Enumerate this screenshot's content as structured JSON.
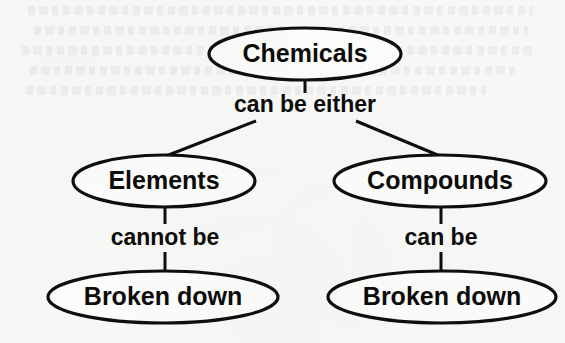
{
  "diagram": {
    "type": "concept-map",
    "title_text_present": false,
    "background_color": "#f7f7f6",
    "ink_color": "#100f0d",
    "nodes": [
      {
        "id": "chemicals",
        "label": "Chemicals",
        "shape": "ellipse",
        "cx": 305,
        "cy": 54,
        "rx": 96,
        "ry": 26,
        "font_size": 25
      },
      {
        "id": "elements",
        "label": "Elements",
        "shape": "ellipse",
        "cx": 164,
        "cy": 181,
        "rx": 91,
        "ry": 26,
        "font_size": 25
      },
      {
        "id": "compounds",
        "label": "Compounds",
        "shape": "ellipse",
        "cx": 440,
        "cy": 181,
        "rx": 106,
        "ry": 26,
        "font_size": 25
      },
      {
        "id": "broken-down-left",
        "label": "Broken down",
        "shape": "ellipse",
        "cx": 163,
        "cy": 297,
        "rx": 115,
        "ry": 26,
        "font_size": 25
      },
      {
        "id": "broken-down-right",
        "label": "Broken down",
        "shape": "ellipse",
        "cx": 442,
        "cy": 297,
        "rx": 114,
        "ry": 26,
        "font_size": 25
      }
    ],
    "edge_labels": [
      {
        "id": "can-be-either",
        "label": "can be either",
        "x": 305,
        "y": 105,
        "font_size": 23
      },
      {
        "id": "cannot-be",
        "label": "cannot be",
        "x": 165,
        "y": 238,
        "font_size": 23
      },
      {
        "id": "can-be",
        "label": "can be",
        "x": 441,
        "y": 238,
        "font_size": 23
      }
    ],
    "connectors": [
      {
        "id": "chemicals-to-label",
        "x1": 305,
        "y1": 80,
        "x2": 305,
        "y2": 93,
        "width": 3
      },
      {
        "id": "label-to-elements",
        "x1": 256,
        "y1": 121,
        "x2": 166,
        "y2": 156,
        "width": 3
      },
      {
        "id": "label-to-compounds",
        "x1": 356,
        "y1": 121,
        "x2": 440,
        "y2": 156,
        "width": 3
      },
      {
        "id": "elements-to-cannot-be",
        "x1": 165,
        "y1": 207,
        "x2": 165,
        "y2": 224,
        "width": 3
      },
      {
        "id": "cannot-be-to-broken-down",
        "x1": 165,
        "y1": 252,
        "x2": 165,
        "y2": 272,
        "width": 3
      },
      {
        "id": "compounds-to-can-be",
        "x1": 441,
        "y1": 207,
        "x2": 441,
        "y2": 224,
        "width": 3
      },
      {
        "id": "can-be-to-broken-down",
        "x1": 441,
        "y1": 252,
        "x2": 441,
        "y2": 272,
        "width": 3
      }
    ]
  }
}
